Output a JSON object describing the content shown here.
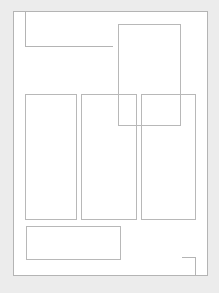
{
  "canvas": {
    "width": 219,
    "height": 293,
    "background": "#ececec"
  },
  "wireframe": {
    "stroke_color": "#b4b4b4",
    "fill_color": "#ffffff",
    "outer_frame": {
      "x": 13,
      "y": 11,
      "w": 195,
      "h": 265
    },
    "header_box": {
      "x": 25,
      "y": 11,
      "w": 88,
      "h": 36,
      "open_edges": [
        "top",
        "right"
      ]
    },
    "floating_panel": {
      "x": 118,
      "y": 24,
      "w": 63,
      "h": 102
    },
    "columns": [
      {
        "x": 25,
        "y": 94,
        "w": 52,
        "h": 126
      },
      {
        "x": 81,
        "y": 94,
        "w": 56,
        "h": 126
      },
      {
        "x": 141,
        "y": 94,
        "w": 55,
        "h": 126
      }
    ],
    "footer_box": {
      "x": 26,
      "y": 226,
      "w": 95,
      "h": 34
    },
    "corner_mark": {
      "x": 182,
      "y": 257,
      "w": 14,
      "h": 19
    }
  }
}
